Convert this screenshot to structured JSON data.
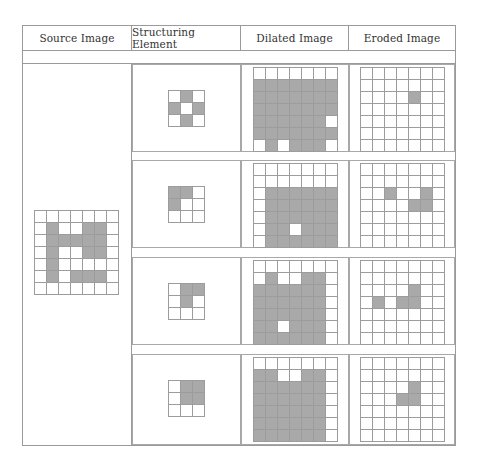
{
  "headers": [
    "Source Image",
    "Structuring Element",
    "Dilated Image",
    "Eroded Image"
  ],
  "colors": {
    "filled": "#a9a9a9",
    "empty": "#ffffff",
    "grid_line": "#9c9c9c"
  },
  "source_image": {
    "size": [
      7,
      7
    ],
    "filled": [
      [
        1,
        1
      ],
      [
        1,
        4
      ],
      [
        1,
        5
      ],
      [
        2,
        1
      ],
      [
        2,
        2
      ],
      [
        2,
        3
      ],
      [
        2,
        4
      ],
      [
        2,
        5
      ],
      [
        3,
        1
      ],
      [
        3,
        4
      ],
      [
        3,
        5
      ],
      [
        4,
        1
      ],
      [
        5,
        1
      ],
      [
        5,
        3
      ],
      [
        5,
        4
      ],
      [
        5,
        5
      ]
    ]
  },
  "rows": [
    {
      "structuring_element": {
        "size": [
          3,
          3
        ],
        "filled": [
          [
            0,
            1
          ],
          [
            1,
            0
          ],
          [
            1,
            2
          ],
          [
            2,
            1
          ]
        ]
      },
      "dilated": {
        "size": [
          7,
          7
        ],
        "filled": [
          [
            1,
            0
          ],
          [
            1,
            1
          ],
          [
            1,
            2
          ],
          [
            1,
            3
          ],
          [
            1,
            4
          ],
          [
            1,
            5
          ],
          [
            1,
            6
          ],
          [
            2,
            0
          ],
          [
            2,
            1
          ],
          [
            2,
            2
          ],
          [
            2,
            3
          ],
          [
            2,
            4
          ],
          [
            2,
            5
          ],
          [
            2,
            6
          ],
          [
            3,
            0
          ],
          [
            3,
            1
          ],
          [
            3,
            2
          ],
          [
            3,
            3
          ],
          [
            3,
            4
          ],
          [
            3,
            5
          ],
          [
            3,
            6
          ],
          [
            4,
            0
          ],
          [
            4,
            1
          ],
          [
            4,
            2
          ],
          [
            4,
            3
          ],
          [
            4,
            4
          ],
          [
            4,
            5
          ],
          [
            5,
            0
          ],
          [
            5,
            1
          ],
          [
            5,
            2
          ],
          [
            5,
            3
          ],
          [
            5,
            4
          ],
          [
            5,
            5
          ],
          [
            5,
            6
          ],
          [
            6,
            1
          ],
          [
            6,
            3
          ],
          [
            6,
            4
          ],
          [
            6,
            5
          ]
        ]
      },
      "eroded": {
        "size": [
          7,
          7
        ],
        "filled": [
          [
            2,
            4
          ]
        ]
      }
    },
    {
      "structuring_element": {
        "size": [
          3,
          3
        ],
        "filled": [
          [
            0,
            0
          ],
          [
            0,
            1
          ],
          [
            1,
            0
          ]
        ]
      },
      "dilated": {
        "size": [
          7,
          7
        ],
        "filled": [
          [
            2,
            1
          ],
          [
            2,
            2
          ],
          [
            2,
            3
          ],
          [
            2,
            4
          ],
          [
            2,
            5
          ],
          [
            2,
            6
          ],
          [
            3,
            1
          ],
          [
            3,
            2
          ],
          [
            3,
            3
          ],
          [
            3,
            4
          ],
          [
            3,
            5
          ],
          [
            3,
            6
          ],
          [
            4,
            1
          ],
          [
            4,
            2
          ],
          [
            4,
            3
          ],
          [
            4,
            4
          ],
          [
            4,
            5
          ],
          [
            4,
            6
          ],
          [
            5,
            1
          ],
          [
            5,
            2
          ],
          [
            5,
            4
          ],
          [
            5,
            5
          ],
          [
            5,
            6
          ],
          [
            6,
            1
          ],
          [
            6,
            2
          ],
          [
            6,
            3
          ],
          [
            6,
            4
          ],
          [
            6,
            5
          ],
          [
            6,
            6
          ]
        ]
      },
      "eroded": {
        "size": [
          7,
          7
        ],
        "filled": [
          [
            2,
            2
          ],
          [
            2,
            5
          ],
          [
            3,
            4
          ],
          [
            3,
            5
          ]
        ]
      }
    },
    {
      "structuring_element": {
        "size": [
          3,
          3
        ],
        "filled": [
          [
            0,
            1
          ],
          [
            0,
            2
          ],
          [
            1,
            1
          ]
        ]
      },
      "dilated": {
        "size": [
          7,
          7
        ],
        "filled": [
          [
            1,
            1
          ],
          [
            1,
            4
          ],
          [
            1,
            5
          ],
          [
            2,
            0
          ],
          [
            2,
            1
          ],
          [
            2,
            2
          ],
          [
            2,
            3
          ],
          [
            2,
            4
          ],
          [
            2,
            5
          ],
          [
            3,
            0
          ],
          [
            3,
            1
          ],
          [
            3,
            2
          ],
          [
            3,
            3
          ],
          [
            3,
            4
          ],
          [
            3,
            5
          ],
          [
            4,
            0
          ],
          [
            4,
            1
          ],
          [
            4,
            2
          ],
          [
            4,
            3
          ],
          [
            4,
            4
          ],
          [
            4,
            5
          ],
          [
            5,
            0
          ],
          [
            5,
            1
          ],
          [
            5,
            3
          ],
          [
            5,
            4
          ],
          [
            5,
            5
          ],
          [
            6,
            0
          ],
          [
            6,
            1
          ],
          [
            6,
            2
          ],
          [
            6,
            3
          ],
          [
            6,
            4
          ],
          [
            6,
            5
          ]
        ]
      },
      "eroded": {
        "size": [
          7,
          7
        ],
        "filled": [
          [
            2,
            4
          ],
          [
            3,
            1
          ],
          [
            3,
            3
          ],
          [
            3,
            4
          ]
        ]
      }
    },
    {
      "structuring_element": {
        "size": [
          3,
          3
        ],
        "filled": [
          [
            0,
            1
          ],
          [
            0,
            2
          ],
          [
            1,
            1
          ],
          [
            1,
            2
          ]
        ]
      },
      "dilated": {
        "size": [
          7,
          7
        ],
        "filled": [
          [
            1,
            0
          ],
          [
            1,
            1
          ],
          [
            1,
            4
          ],
          [
            1,
            5
          ],
          [
            2,
            0
          ],
          [
            2,
            1
          ],
          [
            2,
            2
          ],
          [
            2,
            3
          ],
          [
            2,
            4
          ],
          [
            2,
            5
          ],
          [
            3,
            0
          ],
          [
            3,
            1
          ],
          [
            3,
            2
          ],
          [
            3,
            3
          ],
          [
            3,
            4
          ],
          [
            3,
            5
          ],
          [
            4,
            0
          ],
          [
            4,
            1
          ],
          [
            4,
            2
          ],
          [
            4,
            3
          ],
          [
            4,
            4
          ],
          [
            4,
            5
          ],
          [
            5,
            0
          ],
          [
            5,
            1
          ],
          [
            5,
            2
          ],
          [
            5,
            3
          ],
          [
            5,
            4
          ],
          [
            5,
            5
          ],
          [
            6,
            0
          ],
          [
            6,
            1
          ],
          [
            6,
            2
          ],
          [
            6,
            3
          ],
          [
            6,
            4
          ],
          [
            6,
            5
          ]
        ]
      },
      "eroded": {
        "size": [
          7,
          7
        ],
        "filled": [
          [
            2,
            4
          ],
          [
            3,
            3
          ],
          [
            3,
            4
          ]
        ]
      }
    }
  ]
}
